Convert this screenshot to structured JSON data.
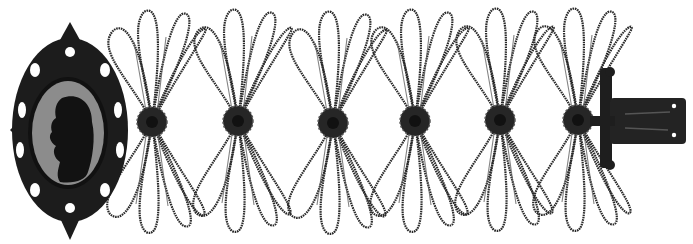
{
  "image": {
    "subject": "Cast iron bracelet with cameo medallion and mesh bow links",
    "background": "#ffffff",
    "ink": "#1e1e1e",
    "cameo": {
      "cx": 68,
      "cy": 135,
      "rx": 38,
      "ry": 54,
      "ground": "#8c8c8c"
    },
    "rosettes": [
      {
        "cx": 152,
        "cy": 122
      },
      {
        "cx": 238,
        "cy": 121
      },
      {
        "cx": 333,
        "cy": 123
      },
      {
        "cx": 415,
        "cy": 121
      },
      {
        "cx": 500,
        "cy": 120
      },
      {
        "cx": 578,
        "cy": 120
      }
    ],
    "clasp": {
      "x": 600,
      "y": 65,
      "plate_w": 85,
      "plate_h": 46
    }
  }
}
